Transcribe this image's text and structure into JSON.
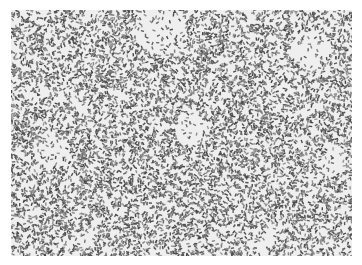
{
  "image": {
    "kind": "grayscale histology micrograph",
    "description": "Densely packed spindle-shaped cells with scattered pale stromal areas",
    "colors": {
      "background": "#ffffff",
      "cell_dark": "#3a3a3a",
      "cell_mid": "#8a8a8a",
      "stroma_light": "#e6e6e6"
    },
    "region": {
      "x": 11,
      "y": 10,
      "width": 341,
      "height": 246
    }
  }
}
